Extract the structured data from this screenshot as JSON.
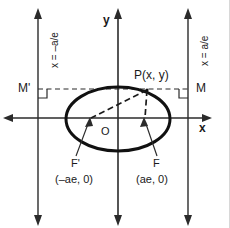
{
  "figure": {
    "background_color": "#ffffff",
    "stroke_color": "#1a1a1a",
    "width": 230,
    "height": 228
  },
  "axes": {
    "x_label": "x",
    "y_label": "y",
    "origin_label": "O"
  },
  "curve": {
    "name": "ellipse",
    "center": [
      118,
      119
    ],
    "semi_major_px": 52,
    "semi_minor_px": 32
  },
  "point": {
    "label": "P(x, y)",
    "coords_text": "(x, y)"
  },
  "foci": [
    {
      "name": "focus-left",
      "label": "F'",
      "coords": "(–ae, 0)"
    },
    {
      "name": "focus-right",
      "label": "F",
      "coords": "(ae, 0)"
    }
  ],
  "directrices": [
    {
      "name": "directrix-left",
      "label": "x = –a/e",
      "foot_label": "M'"
    },
    {
      "name": "directrix-right",
      "label": "x = a/e",
      "foot_label": "M"
    }
  ],
  "feet": {
    "left_label": "M'",
    "right_label": "M"
  }
}
